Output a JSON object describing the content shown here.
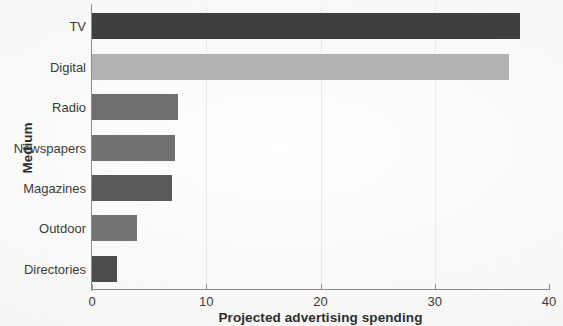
{
  "chart_data": {
    "type": "bar",
    "orientation": "horizontal",
    "title": "",
    "xlabel": "Projected advertising spending",
    "ylabel": "Medium",
    "categories": [
      "TV",
      "Digital",
      "Radio",
      "Newspapers",
      "Magazines",
      "Outdoor",
      "Directories"
    ],
    "values": [
      37.5,
      36.5,
      7.5,
      7.3,
      7.0,
      3.9,
      2.2
    ],
    "bar_colors": [
      "#3f3f3f",
      "#b2b2b2",
      "#6e6e6e",
      "#717171",
      "#5a5a5a",
      "#737373",
      "#4c4c4c"
    ],
    "xlim": [
      0,
      40
    ],
    "xticks": [
      0,
      10,
      20,
      30,
      40
    ],
    "xtick_labels": [
      "0",
      "10",
      "20",
      "30",
      "40"
    ],
    "grid": "vertical-dotted",
    "legend": "none",
    "series": [
      {
        "name": "Projected advertising spending",
        "values": [
          37.5,
          36.5,
          7.5,
          7.3,
          7.0,
          3.9,
          2.2
        ]
      }
    ]
  },
  "axes": {
    "x_title": "Projected advertising spending",
    "y_title": "Medium",
    "x_ticks": [
      {
        "label": "0",
        "value": 0
      },
      {
        "label": "10",
        "value": 10
      },
      {
        "label": "20",
        "value": 20
      },
      {
        "label": "30",
        "value": 30
      },
      {
        "label": "40",
        "value": 40
      }
    ],
    "y_ticks": [
      {
        "label": "TV"
      },
      {
        "label": "Digital"
      },
      {
        "label": "Radio"
      },
      {
        "label": "Newspapers"
      },
      {
        "label": "Magazines"
      },
      {
        "label": "Outdoor"
      },
      {
        "label": "Directories"
      }
    ]
  },
  "style": {
    "background": "#fbfbfa",
    "axis_color": "#8d8d8d",
    "grid_color": "#d9d9d7",
    "text_color": "#3b3b3b",
    "title_color": "#2e2e2e"
  }
}
